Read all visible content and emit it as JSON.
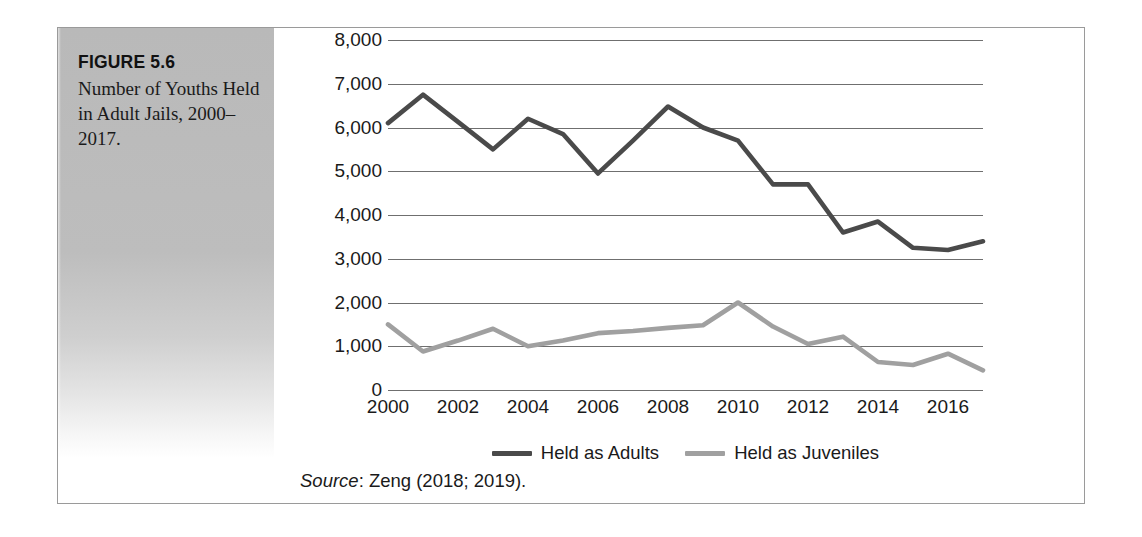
{
  "figure": {
    "label": "FIGURE 5.6",
    "caption": "Number of Youths Held in Adult Jails, 2000–2017.",
    "source_word": "Source",
    "source_rest": ": Zeng (2018; 2019)."
  },
  "colors": {
    "adults_line": "#4a4a4a",
    "juveniles_line": "#a0a0a0",
    "gridline": "#6f6f6f",
    "frame": "#9a9a9a",
    "panel_gray": "#bdbdbd",
    "text": "#1a1a1a"
  },
  "chart_data": {
    "type": "line",
    "title": "Number of Youths Held in Adult Jails, 2000–2017.",
    "xlabel": "",
    "ylabel": "",
    "ylim": [
      0,
      8000
    ],
    "xlim": [
      2000,
      2017
    ],
    "ytick_labels": [
      "8,000",
      "7,000",
      "6,000",
      "5,000",
      "4,000",
      "3,000",
      "2,000",
      "1,000",
      "0"
    ],
    "ytick_values": [
      8000,
      7000,
      6000,
      5000,
      4000,
      3000,
      2000,
      1000,
      0
    ],
    "xtick_labels": [
      "2000",
      "2002",
      "2004",
      "2006",
      "2008",
      "2010",
      "2012",
      "2014",
      "2016"
    ],
    "xtick_values": [
      2000,
      2002,
      2004,
      2006,
      2008,
      2010,
      2012,
      2014,
      2016
    ],
    "x": [
      2000,
      2001,
      2002,
      2003,
      2004,
      2005,
      2006,
      2007,
      2008,
      2009,
      2010,
      2011,
      2012,
      2013,
      2014,
      2015,
      2016,
      2017
    ],
    "grid": true,
    "legend_position": "bottom",
    "series": [
      {
        "name": "Held as Adults",
        "color": "#4a4a4a",
        "values": [
          6100,
          6750,
          6130,
          5500,
          6200,
          5850,
          4950,
          5700,
          6480,
          6000,
          5700,
          4700,
          4700,
          3600,
          3850,
          3250,
          3200,
          3400
        ]
      },
      {
        "name": "Held as Juveniles",
        "color": "#a0a0a0",
        "values": [
          1500,
          880,
          1130,
          1400,
          1000,
          1130,
          1300,
          1350,
          1420,
          1480,
          2000,
          1450,
          1050,
          1220,
          640,
          570,
          830,
          450
        ]
      }
    ]
  }
}
